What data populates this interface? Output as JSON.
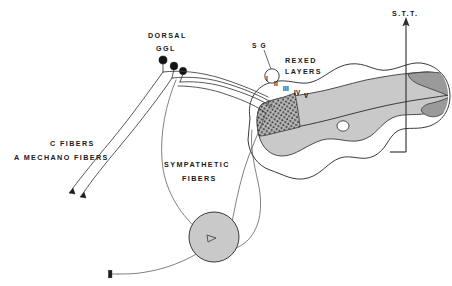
{
  "figure": {
    "background_color": "#ffffff",
    "ink_color": "#1a1a1a"
  },
  "labels": {
    "dorsal_ggl_line1": "DORSAL",
    "dorsal_ggl_line2": "GGL",
    "c_fibers": "C FIBERS",
    "a_mechano_fibers": "A MECHANO FIBERS",
    "sympathetic_line1": "SYMPATHETIC",
    "sympathetic_line2": "FIBERS",
    "sg": "S G",
    "rexed_line1": "REXED",
    "rexed_line2": "LAYERS",
    "stt": "S.T.T."
  },
  "rexed_layers": {
    "name": "rexed-laminae",
    "numerals": [
      "I",
      "II",
      "III",
      "IV",
      "V"
    ]
  },
  "structures": {
    "dorsal_root_ganglion": {
      "name": "dorsal-root-ganglion",
      "cell_body_count": 3
    },
    "sympathetic_ganglion": {
      "name": "sympathetic-ganglion",
      "fill": "#c9c9c9"
    },
    "substantia_gelatinosa": {
      "name": "substantia-gelatinosa",
      "fill": "#ffffff"
    },
    "gray_matter": {
      "name": "spinal-gray-matter",
      "fill": "#c9c9c9"
    },
    "stt_tract_region": {
      "name": "spinothalamic-tract-region",
      "fill": "#9a9a9a"
    },
    "central_canal": {
      "name": "central-canal",
      "fill": "#ffffff"
    },
    "dorsal_horn_stipple": {
      "name": "dorsal-horn-stippled-laminae",
      "fill": "#8f8f8f"
    }
  },
  "colors": {
    "gray_light": "#c9c9c9",
    "gray_dark": "#9a9a9a",
    "stipple": "#8f8f8f",
    "outline": "#3a3a3a",
    "fiber": "#3b3b40"
  }
}
